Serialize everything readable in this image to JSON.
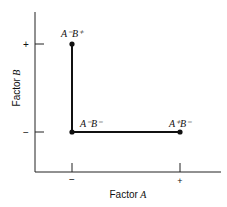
{
  "diagram": {
    "x_axis": {
      "label_prefix": "Factor",
      "label_var": "A",
      "ticks": [
        "−",
        "+"
      ]
    },
    "y_axis": {
      "label_prefix": "Factor",
      "label_var": "B",
      "ticks": [
        "−",
        "+"
      ]
    },
    "points": [
      {
        "label": "A⁻B⁺",
        "a": "−",
        "b": "+"
      },
      {
        "label": "A⁻B⁻",
        "a": "−",
        "b": "−"
      },
      {
        "label": "A⁺B⁻",
        "a": "+",
        "b": "−"
      }
    ],
    "colors": {
      "line": "#111111",
      "point": "#111111",
      "axis": "#222222"
    }
  }
}
